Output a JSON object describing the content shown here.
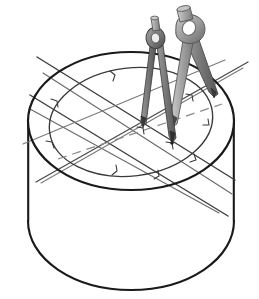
{
  "figure": {
    "title": "Cylinder with scribed circle and two drafting compasses",
    "background_color": "#ffffff",
    "view": "isometric",
    "canvas": {
      "width": 259,
      "height": 299
    }
  },
  "colors": {
    "outline_dark": "#1a1a1a",
    "outline_mid": "#4a4a4a",
    "construction_line": "#5c5c5c",
    "construction_line_light": "#8a8a8a",
    "dashed_line": "#7d7d7d",
    "metal_light": "#b9b9b9",
    "metal_mid": "#8f8f8f",
    "metal_dark": "#6b6b6b",
    "metal_darkest": "#4d4d4d",
    "metal_highlight": "#d6d6d6",
    "face_fill": "#ffffff"
  },
  "geometry": {
    "cylinder": {
      "top_ellipse": {
        "cx": 131,
        "cy": 121,
        "rx": 103,
        "ry": 69,
        "label": "cylinder-top-rim"
      },
      "bottom_ellipse": {
        "cx": 131,
        "cy": 221,
        "rx": 103,
        "ry": 69,
        "label": "cylinder-bottom-rim"
      },
      "height_px": 100,
      "side_left_x": 28,
      "side_right_x": 234
    },
    "scribed_circle": {
      "cx": 131,
      "cy": 122,
      "rx": 82,
      "ry": 54,
      "rotation_deg": -7,
      "label": "scribed-circle-on-top-face"
    },
    "center_point": {
      "x": 172,
      "y": 143,
      "label": "compass-point-convergence"
    },
    "construction_lines_count": 6,
    "dashed_centerline": {
      "from": [
        62,
        156
      ],
      "to": [
        216,
        106
      ]
    },
    "tick_marks_count": 10
  },
  "compasses": [
    {
      "name": "left-compass",
      "label": "drafting-compass-rear",
      "tone": "darker",
      "hinge": {
        "x": 155,
        "y": 38,
        "rx": 10,
        "ry": 11
      },
      "knob_top": {
        "x": 155,
        "y": 16
      },
      "left_leg_tip": {
        "x": 142,
        "y": 128
      },
      "right_leg_tip": {
        "x": 172,
        "y": 143
      }
    },
    {
      "name": "right-compass",
      "label": "drafting-compass-front",
      "tone": "lighter",
      "hinge": {
        "x": 188,
        "y": 30,
        "rx": 14,
        "ry": 13
      },
      "knob_top": {
        "x": 183,
        "y": 8
      },
      "left_leg_tip": {
        "x": 172,
        "y": 126
      },
      "right_leg_tip": {
        "x": 214,
        "y": 96
      }
    }
  ],
  "line_weights": {
    "cylinder_outline": 2.2,
    "scribed_circle": 1.3,
    "construction": 1.2,
    "dashed": 1.1,
    "compass_outline": 1.0
  }
}
